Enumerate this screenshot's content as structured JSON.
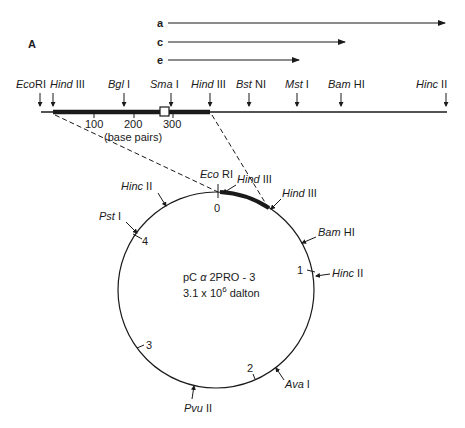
{
  "panel_label": "A",
  "transcripts": [
    {
      "label": "a",
      "x_start": 166,
      "x_end": 445,
      "y": 23
    },
    {
      "label": "c",
      "x_start": 166,
      "x_end": 345,
      "y": 42
    },
    {
      "label": "e",
      "x_start": 166,
      "x_end": 299,
      "y": 60
    }
  ],
  "linear_map": {
    "sites": [
      {
        "italic": "Eco",
        "roman": "RI",
        "x": 40
      },
      {
        "italic": "Hind",
        "roman": " III",
        "x": 53
      },
      {
        "italic": "Bgl",
        "roman": " I",
        "x": 124
      },
      {
        "italic": "Sma",
        "roman": " I",
        "x": 171
      },
      {
        "italic": "Hind",
        "roman": " III",
        "x": 210
      },
      {
        "italic": "Bst",
        "roman": " NI",
        "x": 249
      },
      {
        "italic": "Mst",
        "roman": " I",
        "x": 297
      },
      {
        "italic": "Bam",
        "roman": " HI",
        "x": 341
      },
      {
        "italic": "Hinc",
        "roman": " II",
        "x": 446
      }
    ],
    "scale_ticks": [
      "100",
      "200",
      "300"
    ],
    "scale_unit": "(base pairs)"
  },
  "plasmid": {
    "name_prefix": "pC ",
    "name_greek": "α",
    "name_suffix": " 2PRO - 3",
    "size_prefix": "3.1 x 10",
    "size_exp": "6",
    "size_suffix": " dalton",
    "kb_marks": [
      "0",
      "1",
      "2",
      "3",
      "4"
    ],
    "sites": [
      {
        "italic": "Eco",
        "roman": " RI"
      },
      {
        "italic": "Hind",
        "roman": " III"
      },
      {
        "italic": "Hind",
        "roman": " III"
      },
      {
        "italic": "Bam",
        "roman": " HI"
      },
      {
        "italic": "Hinc",
        "roman": " II"
      },
      {
        "italic": "Ava",
        "roman": " I"
      },
      {
        "italic": "Pvu",
        "roman": " II"
      },
      {
        "italic": "Pst",
        "roman": " I"
      },
      {
        "italic": "Hinc",
        "roman": " II"
      }
    ]
  }
}
